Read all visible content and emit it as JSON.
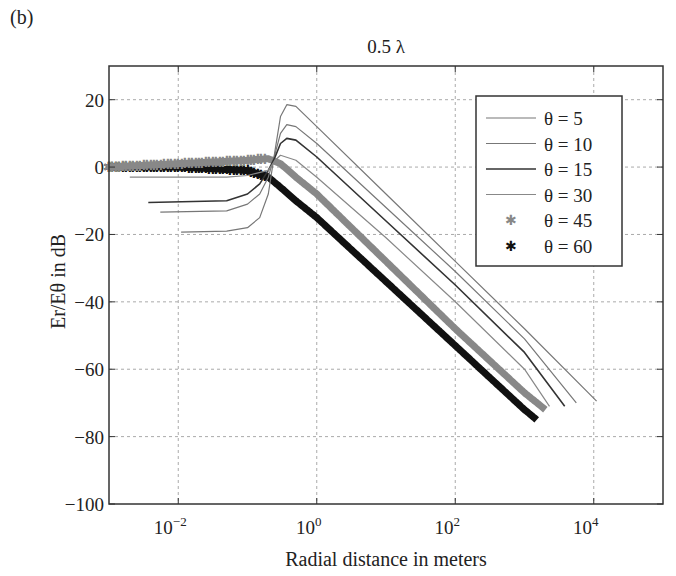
{
  "panel_label": "(b)",
  "chart_data": {
    "type": "line",
    "title": "0.5 λ",
    "xlabel": "Radial distance in meters",
    "ylabel": "Er/Eθ in dB",
    "xscale": "log",
    "xlim": [
      0.001,
      100000
    ],
    "ylim": [
      -100,
      30
    ],
    "grid": true,
    "legend_position": "upper right",
    "x_ticks": [
      0.01,
      1,
      100,
      10000
    ],
    "x_tick_labels": [
      "10^-2",
      "10^0",
      "10^2",
      "10^4"
    ],
    "y_ticks": [
      20,
      0,
      -20,
      -40,
      -60,
      -80,
      -100
    ],
    "y_tick_labels": [
      "20",
      "0",
      "−20",
      "−40",
      "−60",
      "−80",
      "−100"
    ],
    "series": [
      {
        "name": "θ = 5",
        "style": "line",
        "color": "#777777",
        "width": 1.2,
        "points": [
          [
            0.011,
            -19.3
          ],
          [
            0.05,
            -19
          ],
          [
            0.1,
            -18
          ],
          [
            0.15,
            -15
          ],
          [
            0.2,
            -8
          ],
          [
            0.25,
            5
          ],
          [
            0.3,
            15
          ],
          [
            0.37,
            18.5
          ],
          [
            0.5,
            18
          ],
          [
            1,
            12
          ],
          [
            10,
            -8
          ],
          [
            100,
            -28
          ],
          [
            1000,
            -48
          ],
          [
            11000,
            -69.5
          ]
        ]
      },
      {
        "name": "θ = 10",
        "style": "line",
        "color": "#777777",
        "width": 1.2,
        "points": [
          [
            0.0055,
            -13.4
          ],
          [
            0.05,
            -13
          ],
          [
            0.1,
            -11
          ],
          [
            0.15,
            -8
          ],
          [
            0.2,
            -3
          ],
          [
            0.25,
            4
          ],
          [
            0.3,
            10
          ],
          [
            0.37,
            12.6
          ],
          [
            0.5,
            12
          ],
          [
            1,
            7
          ],
          [
            10,
            -12
          ],
          [
            100,
            -31
          ],
          [
            1000,
            -51
          ],
          [
            5600,
            -70
          ]
        ]
      },
      {
        "name": "θ = 15",
        "style": "line",
        "color": "#333333",
        "width": 1.6,
        "points": [
          [
            0.0037,
            -10.5
          ],
          [
            0.05,
            -10
          ],
          [
            0.1,
            -8
          ],
          [
            0.15,
            -5
          ],
          [
            0.2,
            -1
          ],
          [
            0.25,
            3
          ],
          [
            0.3,
            7
          ],
          [
            0.37,
            8.5
          ],
          [
            0.5,
            8
          ],
          [
            1,
            3
          ],
          [
            10,
            -16
          ],
          [
            100,
            -35
          ],
          [
            1000,
            -55
          ],
          [
            3800,
            -71
          ]
        ]
      },
      {
        "name": "θ = 30",
        "style": "line",
        "color": "#888888",
        "width": 1.2,
        "points": [
          [
            0.002,
            -3
          ],
          [
            0.05,
            -3
          ],
          [
            0.1,
            -2.5
          ],
          [
            0.2,
            -1
          ],
          [
            0.25,
            2
          ],
          [
            0.3,
            3.5
          ],
          [
            0.5,
            2
          ],
          [
            1,
            -3
          ],
          [
            10,
            -21
          ],
          [
            100,
            -40
          ],
          [
            1000,
            -60
          ],
          [
            2300,
            -71
          ]
        ]
      },
      {
        "name": "θ = 45",
        "style": "marker-star",
        "color": "#888888",
        "width": 7,
        "points": [
          [
            0.001,
            0
          ],
          [
            0.01,
            1
          ],
          [
            0.1,
            2
          ],
          [
            0.2,
            2.5
          ],
          [
            0.3,
            1
          ],
          [
            0.5,
            -3
          ],
          [
            1,
            -8
          ],
          [
            10,
            -28
          ],
          [
            100,
            -48
          ],
          [
            1000,
            -67
          ],
          [
            2000,
            -72
          ]
        ]
      },
      {
        "name": "θ = 60",
        "style": "marker-star",
        "color": "#111111",
        "width": 7,
        "points": [
          [
            0.001,
            0
          ],
          [
            0.01,
            0
          ],
          [
            0.1,
            -1
          ],
          [
            0.2,
            -3
          ],
          [
            0.3,
            -6
          ],
          [
            0.5,
            -10
          ],
          [
            1,
            -15
          ],
          [
            10,
            -34
          ],
          [
            100,
            -53
          ],
          [
            1000,
            -72
          ],
          [
            1500,
            -75
          ]
        ]
      }
    ]
  }
}
